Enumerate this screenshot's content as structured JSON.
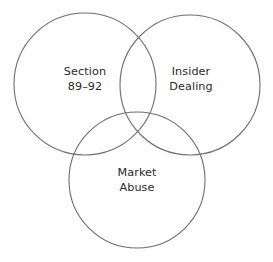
{
  "figure": {
    "type": "venn-diagram",
    "background_color": "#fefefe",
    "stroke_color": "#6e6e6e",
    "text_color": "#2b2b2b",
    "set_count": 3
  },
  "sets": [
    {
      "id": "section-89-92",
      "label_line1": "Section",
      "label_line2": "89–92",
      "label_x": 85,
      "label_y": 79,
      "circle": {
        "cx": 85,
        "cy": 84,
        "r": 71
      }
    },
    {
      "id": "insider-dealing",
      "label_line1": "Insider",
      "label_line2": "Dealing",
      "label_x": 191,
      "label_y": 79,
      "circle": {
        "cx": 190,
        "cy": 85,
        "r": 70
      }
    },
    {
      "id": "market-abuse",
      "label_line1": "Market",
      "label_line2": "Abuse",
      "label_x": 137,
      "label_y": 180,
      "circle": {
        "cx": 137,
        "cy": 180,
        "r": 68
      }
    }
  ]
}
